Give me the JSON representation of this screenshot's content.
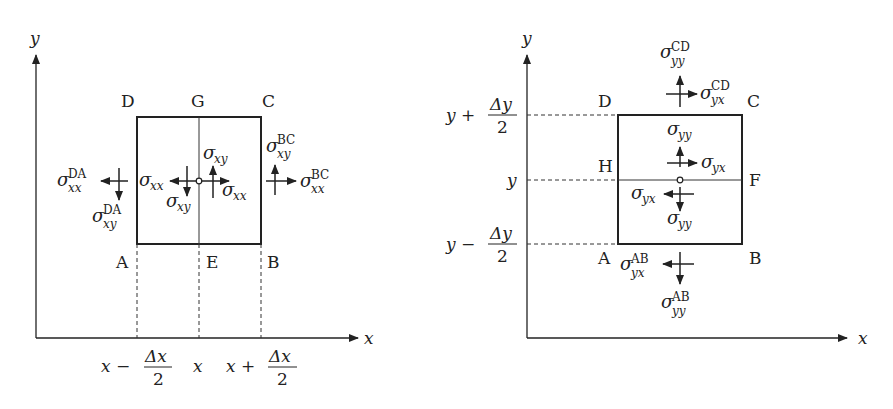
{
  "left_diagram": {
    "axes": {
      "x_label": "x",
      "y_label": "y"
    },
    "corners": {
      "A": "A",
      "B": "B",
      "C": "C",
      "D": "D"
    },
    "midpoints": {
      "top": "G",
      "bottom": "E"
    },
    "ticks": {
      "left": {
        "pre": "x −",
        "num": "Δx",
        "den": "2"
      },
      "center": "x",
      "right": {
        "pre": "x +",
        "num": "Δx",
        "den": "2"
      }
    },
    "stresses": {
      "da_xx": {
        "sym": "σ",
        "sub": "xx",
        "sup": "DA"
      },
      "da_xy": {
        "sym": "σ",
        "sub": "xy",
        "sup": "DA"
      },
      "bc_xx": {
        "sym": "σ",
        "sub": "xx",
        "sup": "BC"
      },
      "bc_xy": {
        "sym": "σ",
        "sub": "xy",
        "sup": "BC"
      },
      "inner_left_xx": {
        "sym": "σ",
        "sub": "xx"
      },
      "inner_left_xy": {
        "sym": "σ",
        "sub": "xy"
      },
      "inner_right_xx": {
        "sym": "σ",
        "sub": "xx"
      },
      "inner_right_xy": {
        "sym": "σ",
        "sub": "xy"
      }
    }
  },
  "right_diagram": {
    "axes": {
      "x_label": "x",
      "y_label": "y"
    },
    "corners": {
      "A": "A",
      "B": "B",
      "C": "C",
      "D": "D"
    },
    "midpoints": {
      "left": "H",
      "right": "F"
    },
    "ticks": {
      "top": {
        "pre": "y +",
        "num": "Δy",
        "den": "2"
      },
      "center": "y",
      "bottom": {
        "pre": "y −",
        "num": "Δy",
        "den": "2"
      }
    },
    "stresses": {
      "cd_yy": {
        "sym": "σ",
        "sub": "yy",
        "sup": "CD"
      },
      "cd_yx": {
        "sym": "σ",
        "sub": "yx",
        "sup": "CD"
      },
      "ab_yy": {
        "sym": "σ",
        "sub": "yy",
        "sup": "AB"
      },
      "ab_yx": {
        "sym": "σ",
        "sub": "yx",
        "sup": "AB"
      },
      "inner_top_yy": {
        "sym": "σ",
        "sub": "yy"
      },
      "inner_top_yx": {
        "sym": "σ",
        "sub": "yx"
      },
      "inner_bottom_yy": {
        "sym": "σ",
        "sub": "yy"
      },
      "inner_bottom_yx": {
        "sym": "σ",
        "sub": "yx"
      }
    }
  }
}
